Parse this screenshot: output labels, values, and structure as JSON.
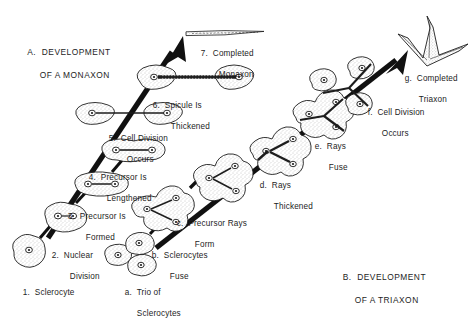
{
  "figure": {
    "background": "#ffffff",
    "ink": "#1d1d1d",
    "sections": [
      {
        "id": "section-a",
        "line1": "A.  DEVELOPMENT",
        "line2": "OF A MONAXON",
        "x": 22,
        "y": 38
      },
      {
        "id": "section-b",
        "line1": "B.  DEVELOPMENT",
        "line2": "OF A TRIAXON",
        "x": 337,
        "y": 261
      }
    ],
    "steps_monaxon": [
      {
        "key": "1",
        "line1": "1.  Sclerocyte",
        "line2": "",
        "x": 18,
        "y": 277
      },
      {
        "key": "2",
        "line1": "2.  Nuclear",
        "line2": "Division",
        "x": 47,
        "y": 240,
        "indent": 18
      },
      {
        "key": "3",
        "line1": "3.  Precursor Is",
        "line2": "Formed",
        "x": 63,
        "y": 201,
        "indent": 18
      },
      {
        "key": "4",
        "line1": "4.  Precursor Is",
        "line2": "Lengthened",
        "x": 84,
        "y": 162,
        "indent": 18
      },
      {
        "key": "5",
        "line1": "5.  Cell Division",
        "line2": "Occurs",
        "x": 104,
        "y": 123,
        "indent": 18
      },
      {
        "key": "6",
        "line1": "6.  Spicule Is",
        "line2": "Thickened",
        "x": 148,
        "y": 90,
        "indent": 18
      },
      {
        "key": "7",
        "line1": "7.  Completed",
        "line2": "Monaxon",
        "x": 196,
        "y": 38,
        "indent": 18
      }
    ],
    "steps_triaxon": [
      {
        "key": "a",
        "line1": "a.  Trio of",
        "line2": "Sclerocytes",
        "x": 120,
        "y": 277,
        "indent": 12
      },
      {
        "key": "b",
        "line1": "b.  Sclerocytes",
        "line2": "Fuse",
        "x": 147,
        "y": 240,
        "indent": 18
      },
      {
        "key": "c",
        "line1": "c.  Precursor Rays",
        "line2": "Form",
        "x": 172,
        "y": 208,
        "indent": 18
      },
      {
        "key": "d",
        "line1": "d.  Rays",
        "line2": "Thickened",
        "x": 255,
        "y": 170,
        "indent": 14
      },
      {
        "key": "e",
        "line1": "e.  Rays",
        "line2": "Fuse",
        "x": 310,
        "y": 131,
        "indent": 14
      },
      {
        "key": "f",
        "line1": "f.  Cell Division",
        "line2": "Occurs",
        "x": 363,
        "y": 97,
        "indent": 14
      },
      {
        "key": "g",
        "line1": "g.  Completed",
        "line2": "Triaxon",
        "x": 400,
        "y": 63,
        "indent": 14
      }
    ],
    "icon_names": {
      "sclerocyte": "amoeboid-cell-icon",
      "nucleus": "nucleus-icon",
      "spicule_rod": "spicule-rod-icon",
      "monaxon_needle": "monaxon-spicule-icon",
      "triaxon_star": "triaxon-spicule-icon",
      "arrow": "process-arrow-icon"
    }
  }
}
